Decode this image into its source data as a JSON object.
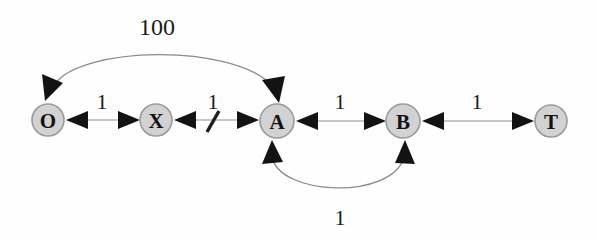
{
  "diagram": {
    "type": "directed-graph",
    "width": 597,
    "height": 240,
    "background_color": "#fefefe",
    "node_fill_color": "#d2d2d2",
    "node_border_color": "#9a9a9a",
    "edge_color": "#8f8f8f",
    "arrow_color": "#131313",
    "text_color": "#131313",
    "nodes": [
      {
        "id": "O",
        "label": "O",
        "x": 48,
        "y": 120,
        "r": 16
      },
      {
        "id": "X",
        "label": "X",
        "x": 156,
        "y": 120,
        "r": 16
      },
      {
        "id": "A",
        "label": "A",
        "x": 277,
        "y": 121,
        "r": 17
      },
      {
        "id": "B",
        "label": "B",
        "x": 403,
        "y": 121,
        "r": 17
      },
      {
        "id": "T",
        "label": "T",
        "x": 551,
        "y": 121,
        "r": 16
      }
    ],
    "edges": [
      {
        "id": "O-X",
        "from": "O",
        "to": "X",
        "weight": "1",
        "shape": "straight",
        "bidirectional": true,
        "label_x": 102,
        "label_y": 101,
        "cut": false
      },
      {
        "id": "X-A",
        "from": "X",
        "to": "A",
        "weight": "1",
        "shape": "straight",
        "bidirectional": true,
        "label_x": 213,
        "label_y": 101,
        "cut": true
      },
      {
        "id": "A-B",
        "from": "A",
        "to": "B",
        "weight": "1",
        "shape": "straight",
        "bidirectional": true,
        "label_x": 340,
        "label_y": 101,
        "cut": false
      },
      {
        "id": "B-T",
        "from": "B",
        "to": "T",
        "weight": "1",
        "shape": "straight",
        "bidirectional": true,
        "label_x": 477,
        "label_y": 101,
        "cut": false
      },
      {
        "id": "O-A-arc",
        "from": "O",
        "to": "A",
        "weight": "100",
        "shape": "arc-top",
        "bidirectional": true,
        "label_x": 157,
        "label_y": 27,
        "cut": false
      },
      {
        "id": "A-B-arc",
        "from": "A",
        "to": "B",
        "weight": "1",
        "shape": "arc-bottom",
        "bidirectional": true,
        "label_x": 340,
        "label_y": 217,
        "cut": false
      }
    ]
  }
}
